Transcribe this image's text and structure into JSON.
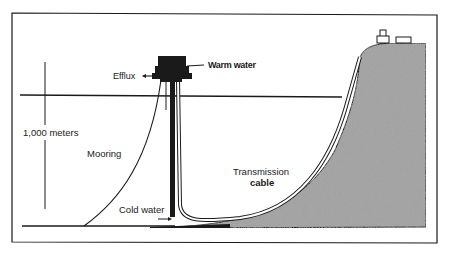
{
  "diagram": {
    "labels": {
      "efflux": "Efflux",
      "warm_water": "Warm water",
      "depth": "1,000 meters",
      "mooring": "Mooring",
      "transmission_cable_line1": "Transmission",
      "transmission_cable_line2": "cable",
      "cold_water": "Cold water"
    },
    "colors": {
      "line": "#1a1a1a",
      "land_fill": "#9a9a9a",
      "background": "#ffffff"
    }
  }
}
